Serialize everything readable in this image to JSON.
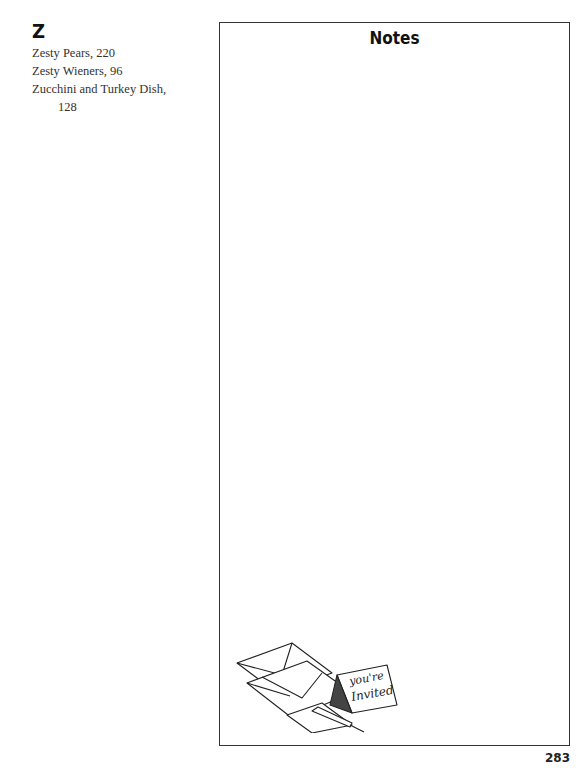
{
  "index": {
    "letter": "Z",
    "entries": [
      {
        "name": "Zesty Pears,",
        "page": "220"
      },
      {
        "name": "Zesty Wieners,",
        "page": "96"
      },
      {
        "name": "Zucchini and Turkey Dish,",
        "page": "128"
      }
    ]
  },
  "notes": {
    "title": "Notes",
    "illustration": {
      "description": "envelopes, pen and card",
      "card_text_line1": "you're",
      "card_text_line2": "Invited"
    }
  },
  "footer": {
    "page_number": "283"
  }
}
